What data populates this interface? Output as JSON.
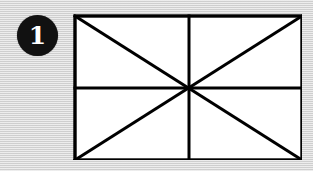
{
  "figure": {
    "badge": {
      "label": "1",
      "shape": "filled-circle",
      "fill_color": "#111111",
      "text_color": "#ffffff"
    },
    "background": {
      "color": "#d6d6d6",
      "texture": "horizontal-scanlines"
    },
    "diagram": {
      "type": "geometric-line-figure",
      "description": "Rectangle divided by vertical midline, horizontal midline and both diagonals",
      "fill_color": "#ffffff",
      "stroke_color": "#000000",
      "stroke_width": 3,
      "rect": {
        "x": 73,
        "y": 14,
        "width": 227,
        "height": 144
      },
      "center_point": {
        "x": 187,
        "y": 86
      },
      "lines": [
        {
          "name": "border-top",
          "x1": 73,
          "y1": 14,
          "x2": 300,
          "y2": 14
        },
        {
          "name": "border-right",
          "x1": 300,
          "y1": 14,
          "x2": 300,
          "y2": 158
        },
        {
          "name": "border-bottom",
          "x1": 300,
          "y1": 158,
          "x2": 73,
          "y2": 158
        },
        {
          "name": "border-left",
          "x1": 73,
          "y1": 158,
          "x2": 73,
          "y2": 14
        },
        {
          "name": "vertical-midline",
          "x1": 187,
          "y1": 14,
          "x2": 187,
          "y2": 158
        },
        {
          "name": "horizontal-midline",
          "x1": 73,
          "y1": 86,
          "x2": 300,
          "y2": 86
        },
        {
          "name": "diagonal-tl-br",
          "x1": 73,
          "y1": 14,
          "x2": 300,
          "y2": 158
        },
        {
          "name": "diagonal-bl-tr",
          "x1": 73,
          "y1": 158,
          "x2": 300,
          "y2": 14
        }
      ]
    }
  }
}
